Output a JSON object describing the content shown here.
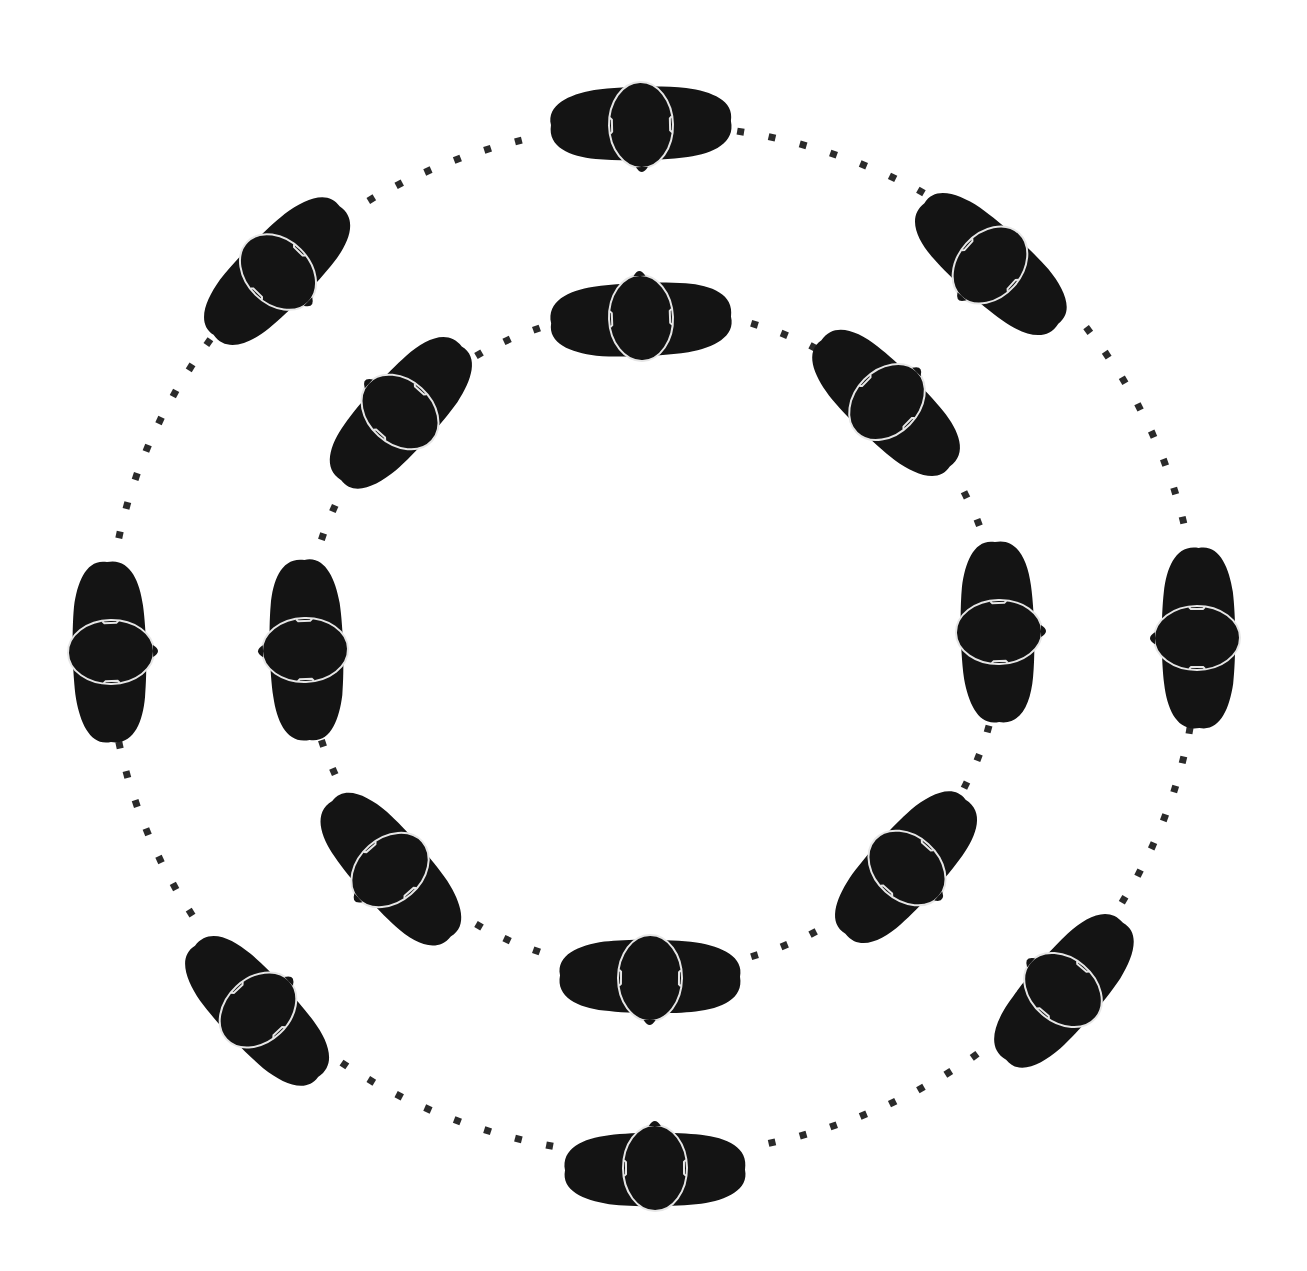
{
  "diagram": {
    "title": "",
    "colors": {
      "figure_fill": "#141414",
      "figure_outline": "#e6e6e6",
      "path_dots": "#2a2a2a",
      "background": "#ffffff"
    },
    "rings": [
      {
        "name": "outer",
        "facing": "inward",
        "person_count": 8,
        "path_style": "dotted"
      },
      {
        "name": "inner",
        "facing": "outward",
        "person_count": 8,
        "path_style": "dotted"
      }
    ],
    "people_positions": [
      "top",
      "top-right",
      "right",
      "bottom-right",
      "bottom",
      "bottom-left",
      "left",
      "top-left"
    ]
  }
}
